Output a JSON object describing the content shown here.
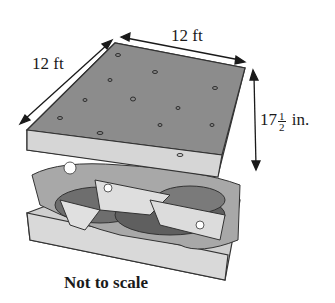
{
  "diagram": {
    "dimensions": {
      "width_label": "12 ft",
      "depth_label": "12 ft",
      "height_whole": "17",
      "height_frac_num": "1",
      "height_frac_den": "2",
      "height_unit": "in."
    },
    "caption": "Not to scale",
    "colors": {
      "bread_top": "#8c8c8c",
      "bread_side": "#d4d4d4",
      "cheese": "#dcdcdc",
      "meat": "#6e6e6e",
      "lettuce": "#a8a8a8",
      "arrow": "#1a1a1a"
    }
  }
}
